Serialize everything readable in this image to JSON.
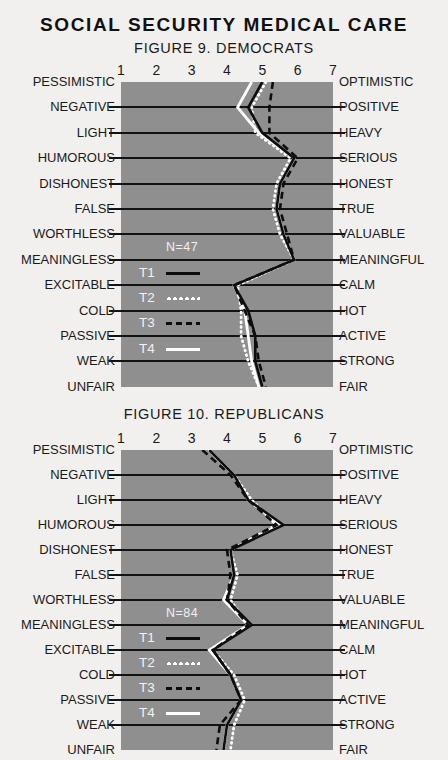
{
  "main_title": "SOCIAL SECURITY MEDICAL CARE",
  "scale_numbers": [
    "1",
    "2",
    "3",
    "4",
    "5",
    "6",
    "7"
  ],
  "left_labels": [
    "PESSIMISTIC",
    "NEGATIVE",
    "LIGHT",
    "HUMOROUS",
    "DISHONEST",
    "FALSE",
    "WORTHLESS",
    "MEANINGLESS",
    "EXCITABLE",
    "COLD",
    "PASSIVE",
    "WEAK",
    "UNFAIR"
  ],
  "right_labels": [
    "OPTIMISTIC",
    "POSITIVE",
    "HEAVY",
    "SERIOUS",
    "HONEST",
    "TRUE",
    "VALUABLE",
    "MEANINGFUL",
    "CALM",
    "HOT",
    "ACTIVE",
    "STRONG",
    "FAIR"
  ],
  "legend": [
    {
      "name": "T1",
      "style": "solid-black",
      "color": "#0d0d0d"
    },
    {
      "name": "T2",
      "style": "dotted-white",
      "color": "#ffffff"
    },
    {
      "name": "T3",
      "style": "dashed-black",
      "color": "#0d0d0d"
    },
    {
      "name": "T4",
      "style": "solid-white",
      "color": "#ffffff"
    }
  ],
  "colors": {
    "plot_background": "#8f8f8f",
    "page_background": "#f2f0ee",
    "gridline": "#121212",
    "text": "#1a1a1a"
  },
  "chart_data": [
    {
      "type": "line",
      "title": "FIGURE 9. DEMOCRATS",
      "sample_size_label": "N=47",
      "xlabel": "",
      "ylabel": "",
      "xlim": [
        1,
        7
      ],
      "grid": true,
      "legend_position": "inside-left",
      "orientation": "horizontal-semantic-differential",
      "categories": [
        "PESSIMISTIC-OPTIMISTIC",
        "NEGATIVE-POSITIVE",
        "LIGHT-HEAVY",
        "HUMOROUS-SERIOUS",
        "DISHONEST-HONEST",
        "FALSE-TRUE",
        "WORTHLESS-VALUABLE",
        "MEANINGLESS-MEANINGFUL",
        "EXCITABLE-CALM",
        "COLD-HOT",
        "PASSIVE-ACTIVE",
        "WEAK-STRONG",
        "UNFAIR-FAIR"
      ],
      "series": [
        {
          "name": "T1",
          "values": [
            5.0,
            4.6,
            5.0,
            5.9,
            5.5,
            5.4,
            5.6,
            5.9,
            4.2,
            4.6,
            4.8,
            4.8,
            5.0
          ]
        },
        {
          "name": "T2",
          "values": [
            5.1,
            4.7,
            4.8,
            5.8,
            5.4,
            5.3,
            5.5,
            5.9,
            4.3,
            4.4,
            4.4,
            4.6,
            4.9
          ]
        },
        {
          "name": "T3",
          "values": [
            5.3,
            5.2,
            5.2,
            6.0,
            5.6,
            5.5,
            5.7,
            5.9,
            4.2,
            4.5,
            4.8,
            4.9,
            5.1
          ]
        },
        {
          "name": "T4",
          "values": [
            4.7,
            4.3,
            4.9,
            5.9,
            5.5,
            5.4,
            5.6,
            5.9,
            4.2,
            4.5,
            4.6,
            4.7,
            4.9
          ]
        }
      ]
    },
    {
      "type": "line",
      "title": "FIGURE 10. REPUBLICANS",
      "sample_size_label": "N=84",
      "xlabel": "",
      "ylabel": "",
      "xlim": [
        1,
        7
      ],
      "grid": true,
      "legend_position": "inside-left",
      "orientation": "horizontal-semantic-differential",
      "categories": [
        "PESSIMISTIC-OPTIMISTIC",
        "NEGATIVE-POSITIVE",
        "LIGHT-HEAVY",
        "HUMOROUS-SERIOUS",
        "DISHONEST-HONEST",
        "FALSE-TRUE",
        "WORTHLESS-VALUABLE",
        "MEANINGLESS-MEANINGFUL",
        "EXCITABLE-CALM",
        "COLD-HOT",
        "PASSIVE-ACTIVE",
        "WEAK-STRONG",
        "UNFAIR-FAIR"
      ],
      "series": [
        {
          "name": "T1",
          "values": [
            3.5,
            4.2,
            4.6,
            5.6,
            4.1,
            4.2,
            4.0,
            4.7,
            3.6,
            4.1,
            4.4,
            4.0,
            3.9
          ]
        },
        {
          "name": "T2",
          "values": [
            3.5,
            4.2,
            4.7,
            5.4,
            4.1,
            4.3,
            4.1,
            4.6,
            3.6,
            4.2,
            4.5,
            4.2,
            4.1
          ]
        },
        {
          "name": "T3",
          "values": [
            3.3,
            4.1,
            4.6,
            5.4,
            4.0,
            4.1,
            4.0,
            4.6,
            3.6,
            4.1,
            4.4,
            3.8,
            3.7
          ]
        },
        {
          "name": "T4",
          "values": [
            3.5,
            4.2,
            4.6,
            5.5,
            4.1,
            4.2,
            3.9,
            4.6,
            3.5,
            4.1,
            4.4,
            4.0,
            3.9
          ]
        }
      ]
    }
  ]
}
